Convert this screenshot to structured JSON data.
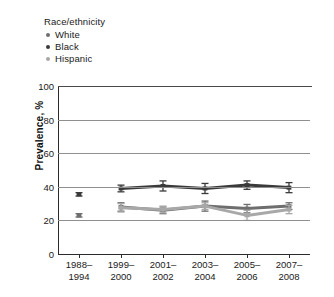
{
  "legend": {
    "title": "Race/ethnicity",
    "entries": [
      {
        "label": "White",
        "color": "#6e6e6e"
      },
      {
        "label": "Black",
        "color": "#3a3a3a"
      },
      {
        "label": "Hispanic",
        "color": "#a8a8a8"
      }
    ]
  },
  "axes": {
    "ylabel": "Prevalence, %",
    "yticks": [
      "0",
      "20",
      "40",
      "60",
      "80",
      "100"
    ],
    "xticks": [
      "1988–\n1994",
      "1999–\n2000",
      "2001–\n2002",
      "2003–\n2004",
      "2005–\n2006",
      "2007–\n2008"
    ]
  },
  "chart_data": {
    "type": "line",
    "title": "",
    "xlabel": "",
    "ylabel": "Prevalence, %",
    "ylim": [
      0,
      100
    ],
    "ytick_values": [
      0,
      20,
      40,
      60,
      80,
      100
    ],
    "grid": true,
    "legend_position": "above-plot-left",
    "categories": [
      "1988–1994",
      "1999–2000",
      "2001–2002",
      "2003–2004",
      "2005–2006",
      "2007–2008"
    ],
    "series": [
      {
        "name": "White",
        "color": "#6e6e6e",
        "values": [
          23.0,
          28.0,
          26.0,
          28.5,
          27.0,
          28.5
        ],
        "errors_low": [
          22.0,
          25.5,
          24.0,
          25.5,
          24.5,
          26.5
        ],
        "errors_high": [
          24.0,
          30.5,
          28.0,
          31.5,
          29.5,
          30.5
        ],
        "connected_from_index": 1
      },
      {
        "name": "Black",
        "color": "#3a3a3a",
        "values": [
          35.5,
          39.0,
          40.5,
          39.0,
          41.0,
          39.5
        ],
        "errors_low": [
          34.5,
          37.0,
          37.5,
          36.0,
          38.5,
          36.5
        ],
        "errors_high": [
          36.5,
          41.0,
          43.5,
          42.0,
          43.5,
          42.5
        ],
        "connected_from_index": 1
      },
      {
        "name": "Hispanic",
        "color": "#a8a8a8",
        "values": [
          null,
          27.5,
          26.5,
          28.5,
          23.0,
          26.5
        ],
        "errors_low": [
          null,
          25.0,
          24.5,
          26.5,
          20.0,
          24.0
        ],
        "errors_high": [
          null,
          30.0,
          28.5,
          30.5,
          26.0,
          29.0
        ],
        "connected_from_index": 1
      }
    ]
  }
}
